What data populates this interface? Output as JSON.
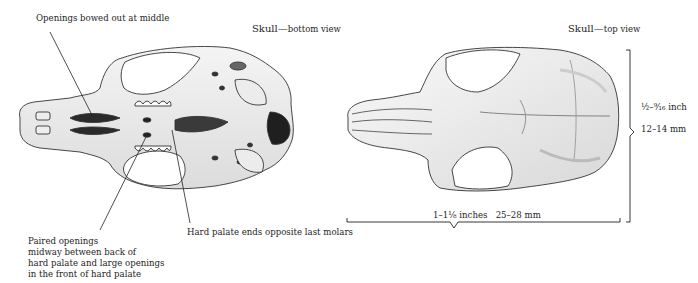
{
  "figure": {
    "bottom_view": {
      "title_main": "Skull",
      "title_dash": "—",
      "title_sub": "bottom view"
    },
    "top_view": {
      "title_main": "Skull",
      "title_dash": "—",
      "title_sub": "top view"
    },
    "annotations": {
      "openings_bowed": "Openings bowed out at middle",
      "paired_openings": [
        "Paired openings",
        "midway between back of",
        "hard palate and large openings",
        "in the front of hard palate"
      ],
      "hard_palate": "Hard palate ends opposite last molars"
    },
    "dimensions": {
      "width_inch": "½–⁹⁄₁₆ inch",
      "width_mm": "12–14 mm",
      "length_inch": "1–1⅛ inches",
      "length_mm": "25–28 mm"
    }
  }
}
